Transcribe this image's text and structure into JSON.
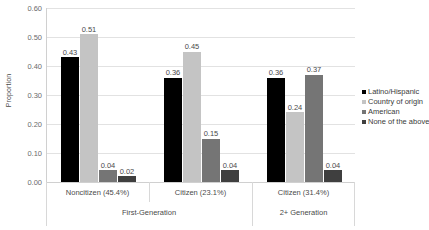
{
  "chart_data": {
    "type": "bar",
    "title": "",
    "xlabel": "",
    "ylabel": "Proportion",
    "ylim": [
      0.0,
      0.6
    ],
    "ytick_labels": [
      "0.60",
      "0.50",
      "0.40",
      "0.30",
      "0.20",
      "0.10",
      "0.00"
    ],
    "ytick_values": [
      0.6,
      0.5,
      0.4,
      0.3,
      0.2,
      0.1,
      0.0
    ],
    "grid": true,
    "legend_position": "right",
    "categories": [
      "Noncitizen (45.4%)",
      "Citizen (23.1%)",
      "Citizen (31.4%)"
    ],
    "group_labels": [
      "First-Generation",
      "2+ Generation"
    ],
    "series": [
      {
        "name": "Latino/Hispanic",
        "color": "#000000",
        "values": [
          0.43,
          0.36,
          0.36
        ],
        "labels": [
          "0.43",
          "0.36",
          "0.36"
        ]
      },
      {
        "name": "Country of origin",
        "color": "#c4c4c4",
        "values": [
          0.51,
          0.45,
          0.24
        ],
        "labels": [
          "0.51",
          "0.45",
          "0.24"
        ]
      },
      {
        "name": "American",
        "color": "#757575",
        "values": [
          0.04,
          0.15,
          0.37
        ],
        "labels": [
          "0.04",
          "0.15",
          "0.37"
        ]
      },
      {
        "name": "None of the above",
        "color": "#3f3f3f",
        "values": [
          0.02,
          0.04,
          0.04
        ],
        "labels": [
          "0.02",
          "0.04",
          "0.04"
        ]
      }
    ]
  }
}
